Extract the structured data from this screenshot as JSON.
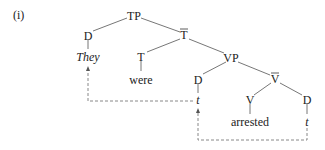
{
  "example_label": "(i)",
  "tree": {
    "root": "TP",
    "nodes": {
      "tp": "TP",
      "d_subj": "D",
      "they": "They",
      "t_bar": "T",
      "t_head": "T",
      "were": "were",
      "vp": "VP",
      "d_spec": "D",
      "trace_spec": "t",
      "v_bar": "V",
      "v_head": "V",
      "arrested": "arrested",
      "d_obj": "D",
      "trace_obj": "t"
    },
    "bar_nodes": [
      "T",
      "V"
    ],
    "movement_arrows": [
      {
        "from": "trace_obj",
        "to": "trace_spec",
        "style": "dashed"
      },
      {
        "from": "trace_spec",
        "to": "they",
        "style": "dashed"
      }
    ]
  }
}
